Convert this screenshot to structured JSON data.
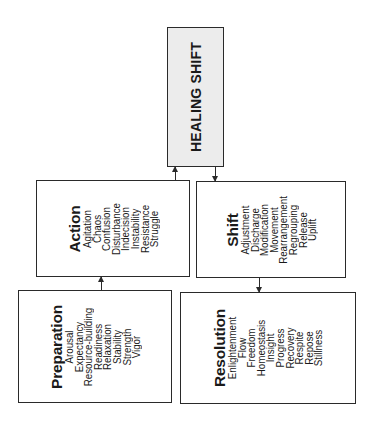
{
  "diagram": {
    "orientation": "rotated-90-counterclockwise",
    "healing_shift": {
      "title": "HEALING SHIFT"
    },
    "boxes": {
      "action": {
        "title": "Action",
        "items": [
          "Agitation",
          "Chaos",
          "Confusion",
          "Disturbance",
          "Indecision",
          "Instability",
          "Resistance",
          "Struggle"
        ]
      },
      "shift": {
        "title": "Shift",
        "items": [
          "Adjustment",
          "Discharge",
          "Modification",
          "Movement",
          "Rearrangement",
          "Regrouping",
          "Release",
          "Uplift"
        ]
      },
      "preparation": {
        "title": "Preparation",
        "items": [
          "Arousal",
          "Expectancy",
          "Resource-building",
          "Readiness",
          "Relaxation",
          "Stability",
          "Strength",
          "Vigor"
        ]
      },
      "resolution": {
        "title": "Resolution",
        "items": [
          "Enlightenment",
          "Flow",
          "Freedom",
          "Homeostasis",
          "Insight",
          "Progress",
          "Recovery",
          "Respite",
          "Repose",
          "Stillness"
        ]
      }
    },
    "arrows": [
      {
        "from": "preparation",
        "to": "action"
      },
      {
        "from": "action",
        "to": "healing_shift"
      },
      {
        "from": "healing_shift",
        "to": "shift"
      },
      {
        "from": "shift",
        "to": "resolution"
      }
    ]
  }
}
